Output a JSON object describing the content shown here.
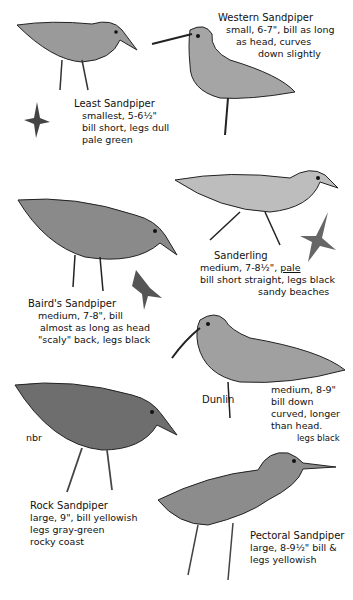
{
  "page": {
    "top_cut_text": "",
    "signature": "nbr"
  },
  "birds": [
    {
      "id": "least",
      "name": "Least Sandpiper",
      "lines": [
        "smallest, 5-6½\"",
        "bill short, legs dull",
        "pale green"
      ]
    },
    {
      "id": "western",
      "name": "Western Sandpiper",
      "lines": [
        "small, 6-7\", bill as long",
        "as head, curves",
        "down slightly"
      ]
    },
    {
      "id": "sanderling",
      "name": "Sanderling",
      "lines": [
        "medium, 7-8½\",",
        "pale",
        "bill short straight, legs black",
        "sandy beaches"
      ]
    },
    {
      "id": "bairds",
      "name": "Baird's Sandpiper",
      "lines": [
        "medium, 7-8\", bill",
        "almost as long as head",
        "\"scaly\" back, legs black"
      ]
    },
    {
      "id": "dunlin",
      "name": "Dunlin",
      "lines": [
        "medium, 8-9\"",
        "bill down",
        "curved, longer",
        "than head.",
        "legs black"
      ]
    },
    {
      "id": "rock",
      "name": "Rock Sandpiper",
      "lines": [
        "large, 9\", bill yellowish",
        "legs gray-green",
        "rocky coast"
      ]
    },
    {
      "id": "pectoral",
      "name": "Pectoral Sandpiper",
      "lines": [
        "large, 8-9½\" bill &",
        "legs yellowish"
      ]
    }
  ]
}
